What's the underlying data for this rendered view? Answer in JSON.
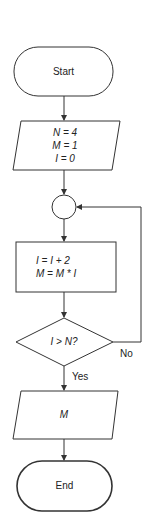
{
  "colors": {
    "stroke": "#333333",
    "text": "#222222",
    "background": "#ffffff"
  },
  "nodes": {
    "start": {
      "type": "terminal",
      "label": "Start"
    },
    "init": {
      "type": "input-output",
      "lines": [
        "N = 4",
        "M = 1",
        "I  = 0"
      ]
    },
    "connector": {
      "type": "connector",
      "label": ""
    },
    "process": {
      "type": "process",
      "lines": [
        "I = I + 2",
        "M = M * I"
      ]
    },
    "decision": {
      "type": "decision",
      "label": "I > N?"
    },
    "output": {
      "type": "input-output",
      "label": "M"
    },
    "end": {
      "type": "terminal",
      "label": "End"
    }
  },
  "edges": {
    "yes_label": "Yes",
    "no_label": "No"
  }
}
